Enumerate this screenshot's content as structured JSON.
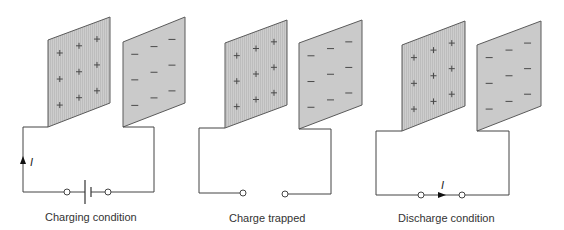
{
  "figure": {
    "panels": [
      {
        "id": "charging",
        "caption": "Charging condition",
        "left_plate_charge": "+",
        "right_plate_charge": "−",
        "charges_per_plate": 9,
        "has_battery": true,
        "circuit_closed": true,
        "current_label": "I",
        "current_direction": "up-left-wire"
      },
      {
        "id": "trapped",
        "caption": "Charge trapped",
        "left_plate_charge": "+",
        "right_plate_charge": "−",
        "charges_per_plate": 9,
        "has_battery": false,
        "circuit_closed": false,
        "current_label": "",
        "current_direction": "none"
      },
      {
        "id": "discharge",
        "caption": "Discharge condition",
        "left_plate_charge": "+",
        "right_plate_charge": "−",
        "charges_per_plate": 9,
        "has_battery": false,
        "circuit_closed": false,
        "current_label": "I",
        "current_direction": "right-bottom-wire"
      }
    ],
    "colors": {
      "plate_fill": "#c9c9c9",
      "plate_edge": "#5a5a5a",
      "wire": "#444444",
      "caption_text": "#333333"
    }
  }
}
